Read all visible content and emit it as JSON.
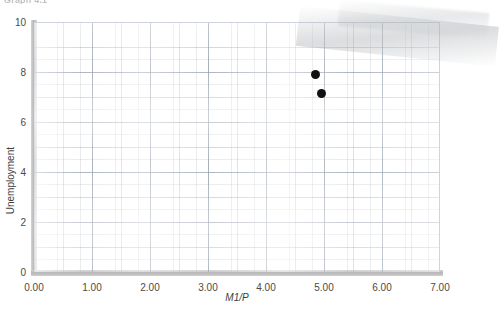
{
  "caption": "Graph 4.1",
  "chart_data": {
    "type": "scatter",
    "title": "Graph 4.1",
    "xlabel": "M1/P",
    "ylabel": "Unemployment",
    "xlim": [
      0,
      7
    ],
    "ylim": [
      0,
      10
    ],
    "grid": true,
    "legend": "none",
    "xticks": [
      "0.00",
      "1.00",
      "2.00",
      "3.00",
      "4.00",
      "5.00",
      "6.00",
      "7.00"
    ],
    "xtick_values": [
      0,
      1,
      2,
      3,
      4,
      5,
      6,
      7
    ],
    "yticks": [
      "0",
      "2",
      "4",
      "6",
      "8",
      "10"
    ],
    "ytick_values": [
      0,
      2,
      4,
      6,
      8,
      10
    ],
    "marker": "filled-circle",
    "marker_color": "#111111",
    "points": [
      {
        "x": 4.85,
        "y": 7.9
      },
      {
        "x": 4.95,
        "y": 7.15
      }
    ]
  },
  "colors": {
    "axis": "#b9b9b9",
    "grid": "#aab2bc",
    "text": "#3d3d3d",
    "marker": "#111111",
    "background": "#ffffff"
  }
}
